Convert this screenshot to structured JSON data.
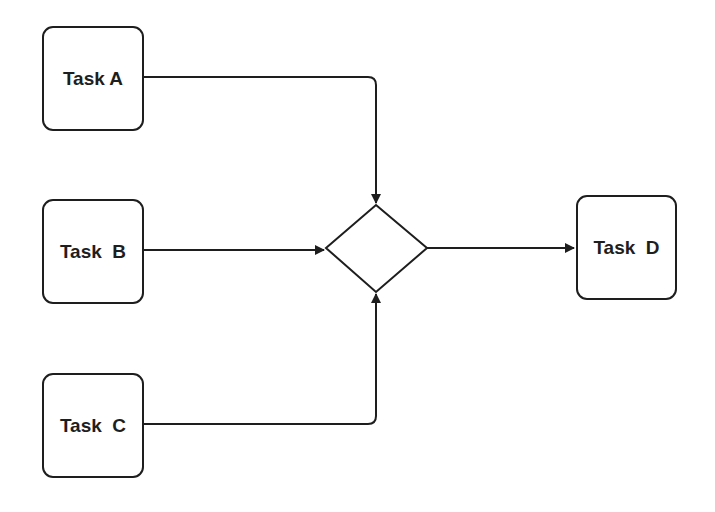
{
  "diagram": {
    "type": "flowchart",
    "nodes": [
      {
        "id": "A",
        "label": "Task A",
        "shape": "rounded-rect"
      },
      {
        "id": "B",
        "label": "Task  B",
        "shape": "rounded-rect"
      },
      {
        "id": "C",
        "label": "Task  C",
        "shape": "rounded-rect"
      },
      {
        "id": "J",
        "label": "",
        "shape": "diamond"
      },
      {
        "id": "D",
        "label": "Task  D",
        "shape": "rounded-rect"
      }
    ],
    "edges": [
      {
        "from": "A",
        "to": "J"
      },
      {
        "from": "B",
        "to": "J"
      },
      {
        "from": "C",
        "to": "J"
      },
      {
        "from": "J",
        "to": "D"
      }
    ],
    "colors": {
      "stroke": "#1e1e1e",
      "background": "#ffffff"
    }
  }
}
